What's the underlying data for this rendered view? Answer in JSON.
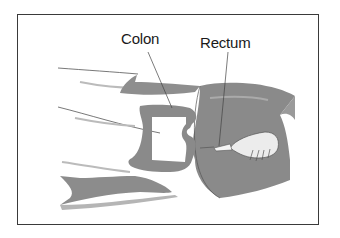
{
  "figure": {
    "type": "medical-illustration",
    "labels": {
      "colon": "Colon",
      "rectum": "Rectum"
    },
    "colors": {
      "body_fill": "#8c8c8c",
      "colon_fill": "#8a8a8a",
      "frame_border": "#3a3a3a",
      "background": "#ffffff"
    }
  }
}
